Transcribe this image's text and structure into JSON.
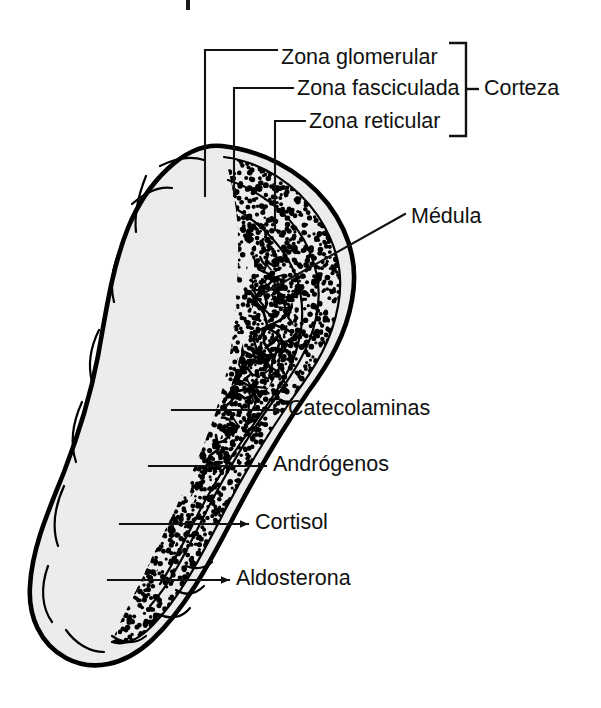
{
  "figure": {
    "background_color": "#ffffff",
    "ink_color": "#111111",
    "tissue_fill_color": "#ececec"
  },
  "zone_labels": [
    {
      "id": "zona-glomerular",
      "text": "Zona glomerular",
      "x": 281,
      "y": 58
    },
    {
      "id": "zona-fasciculada",
      "text": "Zona fasciculada",
      "x": 297,
      "y": 89
    },
    {
      "id": "zona-reticular",
      "text": "Zona reticular",
      "x": 309,
      "y": 122
    }
  ],
  "bracket_label": {
    "id": "corteza",
    "text": "Corteza",
    "x": 484,
    "y": 89
  },
  "medulla_label": {
    "id": "medula",
    "text": "Médula",
    "x": 411,
    "y": 217
  },
  "hormone_labels": [
    {
      "id": "catecolaminas",
      "text": "Catecolaminas",
      "x": 288,
      "y": 408
    },
    {
      "id": "androgenos",
      "text": "Andrógenos",
      "x": 273,
      "y": 464
    },
    {
      "id": "cortisol",
      "text": "Cortisol",
      "x": 255,
      "y": 522
    },
    {
      "id": "aldosterona",
      "text": "Aldosterona",
      "x": 236,
      "y": 578
    }
  ],
  "anatomy_regions": [
    {
      "id": "capsule",
      "name": "Cápsula"
    },
    {
      "id": "zona-glomerular-band",
      "name": "Zona glomerular"
    },
    {
      "id": "zona-fasciculada-band",
      "name": "Zona fasciculada"
    },
    {
      "id": "zona-reticular-band",
      "name": "Zona reticular"
    },
    {
      "id": "medulla-core",
      "name": "Médula"
    }
  ]
}
